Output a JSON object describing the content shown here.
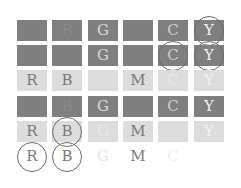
{
  "colors": {
    "dark_cell": "#7f7f7f",
    "light_cell": "#dcdcdc",
    "circle_stroke": "#6a6a6a"
  },
  "grid": {
    "columns": [
      "R",
      "B",
      "G",
      "M",
      "C",
      "Y"
    ],
    "rows": [
      {
        "bg": "dark",
        "cells": [
          {
            "letter": "",
            "color": "#7f7f7f",
            "circled": false
          },
          {
            "letter": "B",
            "color": "#888888",
            "circled": false
          },
          {
            "letter": "G",
            "color": "#d8d8d8",
            "circled": false
          },
          {
            "letter": "",
            "color": "#7f7f7f",
            "circled": false
          },
          {
            "letter": "C",
            "color": "#d0d0d0",
            "circled": false
          },
          {
            "letter": "Y",
            "color": "#f2f2f2",
            "circled": true
          }
        ]
      },
      {
        "bg": "dark",
        "cells": [
          {
            "letter": "",
            "color": "#7f7f7f",
            "circled": false
          },
          {
            "letter": "",
            "color": "#7f7f7f",
            "circled": false
          },
          {
            "letter": "G",
            "color": "#d8d8d8",
            "circled": false
          },
          {
            "letter": "",
            "color": "#7f7f7f",
            "circled": false
          },
          {
            "letter": "C",
            "color": "#d0d0d0",
            "circled": true
          },
          {
            "letter": "Y",
            "color": "#f2f2f2",
            "circled": true
          }
        ]
      },
      {
        "bg": "light",
        "cells": [
          {
            "letter": "R",
            "color": "#7a7a7a",
            "circled": false
          },
          {
            "letter": "B",
            "color": "#7a7a7a",
            "circled": false
          },
          {
            "letter": "",
            "color": "#dcdcdc",
            "circled": false
          },
          {
            "letter": "M",
            "color": "#7a7a7a",
            "circled": false
          },
          {
            "letter": "C",
            "color": "#e6e6e6",
            "circled": false
          },
          {
            "letter": "Y",
            "color": "#f2f2f2",
            "circled": false
          }
        ]
      },
      {
        "bg": "dark",
        "cells": [
          {
            "letter": "",
            "color": "#7f7f7f",
            "circled": false
          },
          {
            "letter": "B",
            "color": "#888888",
            "circled": false
          },
          {
            "letter": "G",
            "color": "#d8d8d8",
            "circled": false
          },
          {
            "letter": "",
            "color": "#7f7f7f",
            "circled": false
          },
          {
            "letter": "C",
            "color": "#d0d0d0",
            "circled": false
          },
          {
            "letter": "Y",
            "color": "#f2f2f2",
            "circled": false
          }
        ]
      },
      {
        "bg": "light",
        "cells": [
          {
            "letter": "R",
            "color": "#7a7a7a",
            "circled": false
          },
          {
            "letter": "B",
            "color": "#7a7a7a",
            "circled": true
          },
          {
            "letter": "G",
            "color": "#e8e8e8",
            "circled": false
          },
          {
            "letter": "M",
            "color": "#7a7a7a",
            "circled": false
          },
          {
            "letter": "",
            "color": "#dcdcdc",
            "circled": false
          },
          {
            "letter": "Y",
            "color": "#f2f2f2",
            "circled": false
          }
        ]
      },
      {
        "bg": "none",
        "cells": [
          {
            "letter": "R",
            "color": "#7a7a7a",
            "circled": true
          },
          {
            "letter": "B",
            "color": "#7a7a7a",
            "circled": true
          },
          {
            "letter": "G",
            "color": "#e6e6e6",
            "circled": false
          },
          {
            "letter": "M",
            "color": "#7a7a7a",
            "circled": false
          },
          {
            "letter": "C",
            "color": "#efefef",
            "circled": false
          },
          {
            "letter": "",
            "color": "#ffffff",
            "circled": false
          }
        ]
      }
    ]
  }
}
